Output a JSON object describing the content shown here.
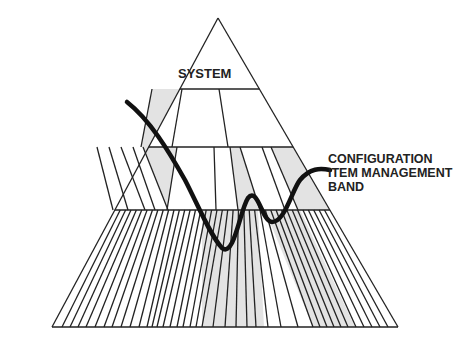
{
  "diagram": {
    "type": "pyramid-hierarchy",
    "top_label": "SYSTEM",
    "band_label_lines": [
      "CONFIGURATION",
      "ITEM MANAGEMENT",
      "BAND"
    ],
    "colors": {
      "line": "#222222",
      "shade": "#e3e3e3",
      "curve": "#111111",
      "background": "#ffffff"
    },
    "apex": [
      218,
      18
    ],
    "tiers": [
      {
        "name": "system",
        "y_top": 18,
        "y_bottom": 89
      },
      {
        "name": "tier-2",
        "y_top": 89,
        "y_bottom": 147,
        "dividers_bottom_x": [
          139,
          169,
          225
        ],
        "shaded": [
          0
        ]
      },
      {
        "name": "tier-3",
        "y_top": 147,
        "y_bottom": 210,
        "shaded": [
          5,
          8,
          10
        ]
      },
      {
        "name": "tier-4",
        "y_top": 210,
        "y_bottom": 327,
        "shaded_range_x": [
          [
            202,
            264
          ],
          [
            300,
            355
          ]
        ]
      }
    ]
  }
}
